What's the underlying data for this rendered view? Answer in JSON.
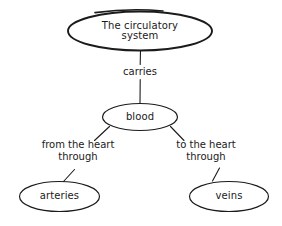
{
  "diagram": {
    "background_color": "#ffffff",
    "ink_color": "#1a1a1a",
    "nodes": [
      {
        "id": "root",
        "label": "The circulatory\nsystem",
        "shape": "ellipse"
      },
      {
        "id": "mid",
        "label": "blood",
        "shape": "ellipse"
      },
      {
        "id": "left",
        "label": "arteries",
        "shape": "ellipse"
      },
      {
        "id": "right",
        "label": "veins",
        "shape": "ellipse"
      }
    ],
    "edge_labels": [
      {
        "id": "carries",
        "text": "carries"
      },
      {
        "id": "from-heart",
        "text": "from the heart\nthrough"
      },
      {
        "id": "to-heart",
        "text": "to the heart\nthrough"
      }
    ]
  }
}
